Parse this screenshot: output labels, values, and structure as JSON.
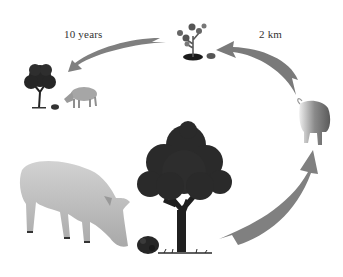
{
  "diagram": {
    "labels": {
      "distance": "2 km",
      "time": "10 years"
    },
    "stages": [
      {
        "id": "mature",
        "items": [
          "large-tree",
          "pig-sniffing",
          "truffle"
        ]
      },
      {
        "id": "dispersal",
        "items": [
          "pig-walking-away"
        ]
      },
      {
        "id": "germination",
        "items": [
          "seedling",
          "truffle"
        ]
      },
      {
        "id": "new-host",
        "items": [
          "small-tree",
          "truffle",
          "pig-sniffing"
        ]
      }
    ],
    "arrows": [
      {
        "from": "mature",
        "to": "dispersal",
        "label": ""
      },
      {
        "from": "dispersal",
        "to": "germination",
        "label": "2 km"
      },
      {
        "from": "germination",
        "to": "new-host",
        "label": "10 years"
      }
    ],
    "colors": {
      "arrow": "#7a7a7a",
      "tree": "#2b2b2b",
      "pig": "#b8b8b8",
      "truffle": "#262626",
      "text": "#333333"
    }
  }
}
